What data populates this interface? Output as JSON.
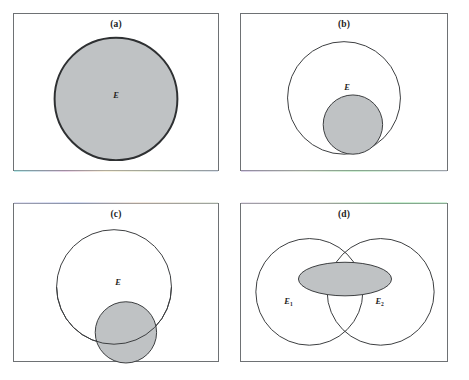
{
  "figure": {
    "background_color": "#ffffff",
    "width": 469,
    "height": 380,
    "shaded_fill_color": "#bfc2c4",
    "outline_color": "#3b3d3f",
    "panel_border_color": "#6e7174"
  },
  "panels": [
    {
      "id": "a",
      "caption": "(a)",
      "description": "Single shaded circle filling most of the box",
      "labels": [
        {
          "text": "E",
          "subscript": "",
          "x": 103,
          "y": 82
        }
      ],
      "shapes": [
        {
          "name": "event-circle-shaded",
          "type": "circle",
          "cx": 103,
          "cy": 86,
          "r": 62,
          "fill": "#bfc2c4",
          "stroke": "#2e3032",
          "stroke_width": 2.0
        }
      ]
    },
    {
      "id": "b",
      "caption": "(b)",
      "description": "Small shaded circle fully contained inside the larger circle E",
      "labels": [
        {
          "text": "E",
          "subscript": "",
          "x": 107,
          "y": 74
        }
      ],
      "shapes": [
        {
          "name": "event-circle-outer",
          "type": "circle",
          "cx": 104,
          "cy": 85,
          "r": 57,
          "fill": "none",
          "stroke": "#3b3d3f",
          "stroke_width": 1.0
        },
        {
          "name": "subset-circle-shaded",
          "type": "circle",
          "cx": 113,
          "cy": 112,
          "r": 30,
          "fill": "#bfc2c4",
          "stroke": "#3b3d3f",
          "stroke_width": 1.0
        }
      ]
    },
    {
      "id": "c",
      "caption": "(c)",
      "description": "Shaded circle straddling the lower boundary of circle E, partly outside",
      "labels": [
        {
          "text": "E",
          "subscript": "",
          "x": 105,
          "y": 79
        }
      ],
      "shapes": [
        {
          "name": "event-circle-outer",
          "type": "circle",
          "cx": 101,
          "cy": 84,
          "r": 58,
          "fill": "none",
          "stroke": "#3b3d3f",
          "stroke_width": 1.0
        },
        {
          "name": "overlap-circle-shaded",
          "type": "circle",
          "cx": 113,
          "cy": 130,
          "r": 31,
          "fill": "#bfc2c4",
          "stroke": "#3b3d3f",
          "stroke_width": 1.0
        }
      ]
    },
    {
      "id": "d",
      "caption": "(d)",
      "description": "Two overlapping circles E1 and E2 with a shaded ellipse spanning both",
      "labels": [
        {
          "text": "E",
          "subscript": "1",
          "x": 48,
          "y": 98
        },
        {
          "text": "E",
          "subscript": "2",
          "x": 140,
          "y": 98
        }
      ],
      "shapes": [
        {
          "name": "event-circle-left",
          "type": "circle",
          "cx": 69,
          "cy": 89,
          "r": 54,
          "fill": "none",
          "stroke": "#3b3d3f",
          "stroke_width": 1.0
        },
        {
          "name": "event-circle-right",
          "type": "circle",
          "cx": 141,
          "cy": 89,
          "r": 54,
          "fill": "none",
          "stroke": "#3b3d3f",
          "stroke_width": 1.0
        },
        {
          "name": "union-ellipse-shaded",
          "type": "ellipse",
          "cx": 105,
          "cy": 76,
          "rx": 47,
          "ry": 17,
          "fill": "#bfc2c4",
          "stroke": "#3b3d3f",
          "stroke_width": 1.0
        }
      ]
    }
  ]
}
